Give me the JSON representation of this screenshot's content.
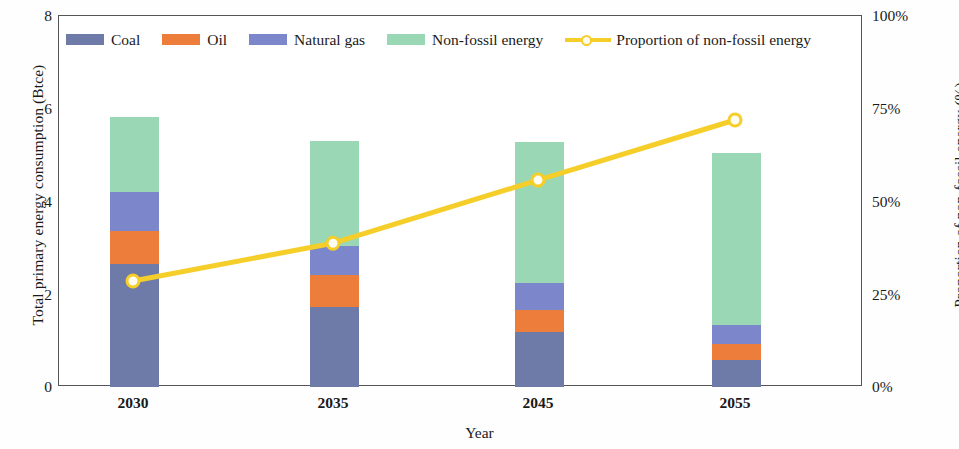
{
  "chart_data": {
    "type": "bar",
    "title": "",
    "subtitle": "",
    "xlabel": "Year",
    "ylabel": "Total primary energy consumption (Btce)",
    "y2label": "Proportion of non-fossil energy (%)",
    "categories": [
      "2030",
      "2035",
      "2045",
      "2055"
    ],
    "ylim": [
      0,
      8
    ],
    "yticks": [
      "0",
      "2",
      "4",
      "6",
      "8"
    ],
    "ytick_values": [
      0,
      2,
      4,
      6,
      8
    ],
    "y2lim": [
      0,
      100
    ],
    "y2ticks": [
      "0%",
      "25%",
      "50%",
      "75%",
      "100%"
    ],
    "y2tick_values": [
      0,
      25,
      50,
      75,
      100
    ],
    "grid": false,
    "legend_position": "top",
    "stacked": true,
    "series": [
      {
        "name": "Coal",
        "color": "#6E7BA8",
        "values": [
          2.65,
          1.72,
          1.18,
          0.59
        ]
      },
      {
        "name": "Oil",
        "color": "#ED7D3A",
        "values": [
          0.72,
          0.7,
          0.47,
          0.33
        ]
      },
      {
        "name": "Natural gas",
        "color": "#7B86CB",
        "values": [
          0.84,
          0.63,
          0.59,
          0.41
        ]
      },
      {
        "name": "Non-fossil energy",
        "color": "#9AD7B4",
        "values": [
          1.61,
          2.26,
          3.04,
          3.72
        ]
      }
    ],
    "line_series": {
      "name": "Proportion of non-fossil energy",
      "color": "#F5CE2A",
      "marker_fill": "#FFFDF2",
      "values": [
        28.3,
        38.5,
        55.5,
        71.7
      ],
      "value_labels": [
        "28%",
        "39%",
        "56%",
        "72%"
      ]
    },
    "totals": [
      5.82,
      5.31,
      5.28,
      5.05
    ]
  },
  "legend": {
    "items": [
      {
        "label": "Coal",
        "color": "#6E7BA8",
        "kind": "swatch"
      },
      {
        "label": "Oil",
        "color": "#ED7D3A",
        "kind": "swatch"
      },
      {
        "label": "Natural gas",
        "color": "#7B86CB",
        "kind": "swatch"
      },
      {
        "label": "Non-fossil energy",
        "color": "#9AD7B4",
        "kind": "swatch"
      },
      {
        "label": "Proportion of non-fossil energy",
        "color": "#F5CE2A",
        "kind": "line"
      }
    ]
  },
  "axes": {
    "left_title": "Total primary energy consumption (Btce)",
    "right_title": "Proportion of non-fossil energy (%)",
    "x_title": "Year",
    "y_ticks": [
      "8",
      "6",
      "4",
      "2",
      "0"
    ],
    "y2_ticks": [
      "100%",
      "75%",
      "50%",
      "25%",
      "0%"
    ],
    "x_ticks": [
      "2030",
      "2035",
      "2045",
      "2055"
    ]
  }
}
